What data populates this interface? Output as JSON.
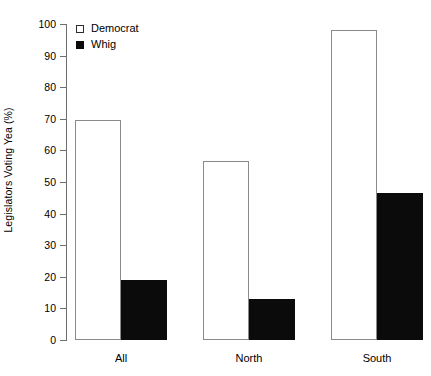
{
  "chart_data": {
    "type": "bar",
    "title": "",
    "subtitle": "",
    "xlabel": "",
    "ylabel": "Legislators Voting Yea (%)",
    "categories": [
      "All",
      "North",
      "South"
    ],
    "series": [
      {
        "name": "Democrat",
        "values": [
          69.5,
          56.5,
          98.0
        ],
        "color": "#ffffff",
        "stroke": "#8a8a8a",
        "swatch_style": "open-square"
      },
      {
        "name": "Whig",
        "values": [
          19.0,
          13.0,
          46.5
        ],
        "color": "#0b0b0b",
        "stroke": "#0b0b0b",
        "swatch_style": "filled-square"
      }
    ],
    "ylim": [
      0,
      100
    ],
    "ytick_values": [
      0,
      10,
      20,
      30,
      40,
      50,
      60,
      70,
      80,
      90,
      100
    ],
    "ytick_labels": [
      "0",
      "10",
      "20",
      "30",
      "40",
      "50",
      "60",
      "70",
      "80",
      "90",
      "100"
    ],
    "grid": false,
    "legend_position": "top-left-inside",
    "bar_grouping": "adjacent-touching",
    "axis_style": "y-axis-only-left-ticks"
  },
  "axis": {
    "y_title": "Legislators Voting Yea (%)"
  },
  "legend": {
    "entries": [
      {
        "label": "Democrat"
      },
      {
        "label": "Whig"
      }
    ]
  }
}
